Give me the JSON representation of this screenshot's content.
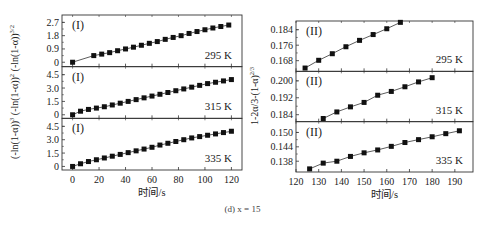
{
  "figure": {
    "caption": "(d) x = 15",
    "left_ylabel_parts": [
      "(-ln(1-α))",
      "3",
      "  (-ln(1-α))",
      "2",
      "  (-ln(1-α))",
      "3/2"
    ],
    "right_ylabel": "1-2α/3-(1-α)",
    "right_ylabel_sup": "2/3",
    "xlabel": "时间/s"
  },
  "chart_data": [
    {
      "type": "scatter",
      "panel": "left",
      "model": "(I)",
      "xlabel": "时间/s",
      "xlim": [
        -8,
        128
      ],
      "xticks": [
        0,
        20,
        40,
        60,
        80,
        100,
        120
      ],
      "subplots": [
        {
          "label": "(I)",
          "temperature": "295 K",
          "ylabel": "(-ln(1-α))^(3/2)",
          "ylim": [
            -0.3,
            3.2
          ],
          "yticks": [
            0,
            0.9,
            1.8,
            2.7
          ],
          "ytick_labels": [
            "0",
            "0.9",
            "1.8",
            "2.7"
          ],
          "x": [
            0,
            16,
            22,
            28,
            34,
            40,
            46,
            52,
            58,
            64,
            70,
            76,
            82,
            88,
            94,
            100,
            106,
            112,
            118
          ],
          "y": [
            0.0,
            0.45,
            0.55,
            0.65,
            0.78,
            0.9,
            1.02,
            1.15,
            1.28,
            1.4,
            1.55,
            1.68,
            1.8,
            1.95,
            2.08,
            2.2,
            2.32,
            2.42,
            2.52
          ]
        },
        {
          "label": "(I)",
          "temperature": "315 K",
          "ylabel": "(-ln(1-α))^2",
          "ylim": [
            -0.4,
            5.4
          ],
          "yticks": [
            0,
            1.5,
            3.0,
            4.5
          ],
          "ytick_labels": [
            "0",
            "1.5",
            "3.0",
            "4.5"
          ],
          "x": [
            0,
            6,
            12,
            18,
            24,
            30,
            36,
            42,
            48,
            54,
            60,
            66,
            72,
            78,
            84,
            90,
            96,
            102,
            108,
            114,
            120
          ],
          "y": [
            0.0,
            0.4,
            0.6,
            0.75,
            0.9,
            1.1,
            1.3,
            1.5,
            1.7,
            1.9,
            2.1,
            2.3,
            2.5,
            2.7,
            2.9,
            3.1,
            3.3,
            3.5,
            3.65,
            3.8,
            3.95
          ]
        },
        {
          "label": "(I)",
          "temperature": "335 K",
          "ylabel": "(-ln(1-α))^3",
          "ylim": [
            -0.4,
            5.4
          ],
          "yticks": [
            0,
            1.5,
            3.0,
            4.5
          ],
          "ytick_labels": [
            "0",
            "1.5",
            "3.0",
            "4.5"
          ],
          "x": [
            0,
            6,
            12,
            18,
            24,
            30,
            36,
            42,
            48,
            54,
            60,
            66,
            72,
            78,
            84,
            90,
            96,
            102,
            108,
            114,
            120
          ],
          "y": [
            0.0,
            0.3,
            0.55,
            0.75,
            0.95,
            1.15,
            1.35,
            1.55,
            1.75,
            1.95,
            2.15,
            2.4,
            2.6,
            2.8,
            3.0,
            3.2,
            3.35,
            3.5,
            3.65,
            3.8,
            3.95
          ]
        }
      ]
    },
    {
      "type": "scatter",
      "panel": "right",
      "model": "(II)",
      "xlabel": "时间/s",
      "ylabel": "1-2α/3-(1-α)^(2/3)",
      "xlim": [
        120,
        198
      ],
      "xticks": [
        120,
        130,
        140,
        150,
        160,
        170,
        180,
        190
      ],
      "subplots": [
        {
          "label": "(II)",
          "temperature": "295 K",
          "ylim": [
            0.1625,
            0.1885
          ],
          "yticks": [
            0.168,
            0.176,
            0.184
          ],
          "ytick_labels": [
            "0.168",
            "0.176",
            "0.184"
          ],
          "x": [
            124,
            130,
            136,
            142,
            148,
            154,
            160,
            166
          ],
          "y": [
            0.1642,
            0.1682,
            0.1716,
            0.1752,
            0.1785,
            0.1815,
            0.1845,
            0.1878
          ]
        },
        {
          "label": "(II)",
          "temperature": "315 K",
          "ylim": [
            0.1807,
            0.2045
          ],
          "yticks": [
            0.184,
            0.192,
            0.2
          ],
          "ytick_labels": [
            "0.184",
            "0.192",
            "0.200"
          ],
          "x": [
            132,
            138,
            144,
            150,
            156,
            162,
            168,
            174,
            180
          ],
          "y": [
            0.1822,
            0.1853,
            0.1877,
            0.1898,
            0.1932,
            0.195,
            0.1972,
            0.1995,
            0.2015
          ]
        },
        {
          "label": "(II)",
          "temperature": "335 K",
          "ylim": [
            0.1335,
            0.1545
          ],
          "yticks": [
            0.138,
            0.144,
            0.15
          ],
          "ytick_labels": [
            "0.138",
            "0.144",
            "0.150"
          ],
          "x": [
            126,
            132,
            138,
            144,
            150,
            156,
            162,
            168,
            174,
            180,
            186,
            192
          ],
          "y": [
            0.1348,
            0.1372,
            0.138,
            0.14,
            0.1415,
            0.1427,
            0.1442,
            0.1458,
            0.147,
            0.1482,
            0.1495,
            0.1507
          ]
        }
      ]
    }
  ]
}
